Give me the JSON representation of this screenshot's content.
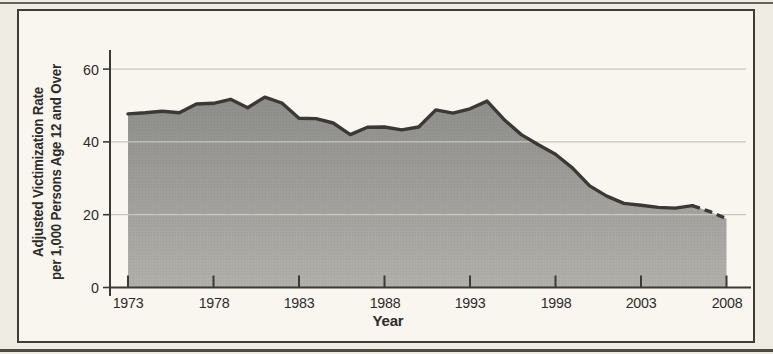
{
  "colors": {
    "bg_outer": "#efece4",
    "bg_inner": "#f9f6f0",
    "frame": "#3e3c36",
    "edge": "#4c4a42",
    "axis": "#3b3a35",
    "grid": "#c9c6bf",
    "line": "#3a3935",
    "text": "#2e2c28",
    "fill_top": "#8d8d8a",
    "fill_bottom": "#b2b0ab"
  },
  "chart_data": {
    "type": "area",
    "title": "",
    "xlabel": "Year",
    "ylabel": "Adjusted Victimization Rate per 1,000 Persons Age 12 and Over",
    "ylabel_line1": "Adjusted Victimization Rate",
    "ylabel_line2": "per 1,000 Persons Age 12 and Over",
    "x": [
      1973,
      1974,
      1975,
      1976,
      1977,
      1978,
      1979,
      1980,
      1981,
      1982,
      1983,
      1984,
      1985,
      1986,
      1987,
      1988,
      1989,
      1990,
      1991,
      1992,
      1993,
      1994,
      1995,
      1996,
      1997,
      1998,
      1999,
      2000,
      2001,
      2002,
      2003,
      2004,
      2005,
      2006,
      2007,
      2008
    ],
    "values": [
      47.7,
      48.0,
      48.4,
      48.0,
      50.4,
      50.6,
      51.7,
      49.4,
      52.3,
      50.7,
      46.5,
      46.4,
      45.2,
      42.0,
      44.0,
      44.1,
      43.3,
      44.1,
      48.8,
      47.9,
      49.1,
      51.2,
      46.1,
      42.0,
      39.2,
      36.6,
      32.8,
      27.9,
      25.1,
      23.1,
      22.6,
      22.0,
      21.8,
      22.5,
      20.9,
      18.9
    ],
    "x_ticks": [
      1973,
      1978,
      1983,
      1988,
      1993,
      1998,
      2003,
      2008
    ],
    "y_ticks": [
      0,
      20,
      40,
      60
    ],
    "xlim": [
      1973,
      2008
    ],
    "ylim": [
      0,
      60
    ],
    "grid": "horizontal gridlines at 20, 40, 60",
    "legend": "none",
    "solid_until_year": 2006,
    "line_style_note": "series line is solid from 1973 through 2006, dashed from 2006 to 2008"
  }
}
